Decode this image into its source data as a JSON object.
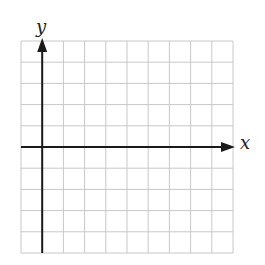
{
  "diagram": {
    "type": "coordinate-grid",
    "grid": {
      "columns": 10,
      "rows": 10,
      "cell_px": 21.2,
      "origin_col": 1,
      "origin_row": 5,
      "line_color": "#c8c8c8",
      "axis_color": "#1a1a1a"
    },
    "x_axis": {
      "label": "x",
      "range": [
        -1,
        9
      ]
    },
    "y_axis": {
      "label": "y",
      "range": [
        -5,
        5
      ]
    }
  }
}
